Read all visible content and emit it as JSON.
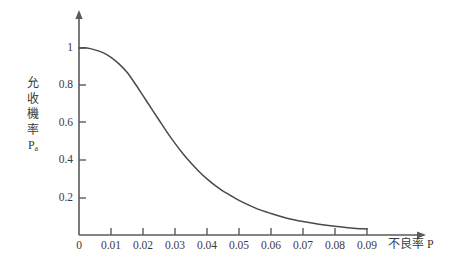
{
  "chart_data": {
    "type": "line",
    "title": "",
    "subtitle": "",
    "xlabel": "不良率 P",
    "ylabel": "允收機率 Pa",
    "ylabel_chars": [
      "允",
      "收",
      "機",
      "率"
    ],
    "ylabel_symbol": "P",
    "ylabel_symbol_sub": "a",
    "xlim": [
      0,
      0.09
    ],
    "ylim": [
      0,
      1.05
    ],
    "grid": false,
    "legend": null,
    "xticks": [
      0,
      0.01,
      0.02,
      0.03,
      0.04,
      0.05,
      0.06,
      0.07,
      0.08,
      0.09
    ],
    "xtick_labels": [
      "0",
      "0.01",
      "0.02",
      "0.03",
      "0.04",
      "0.05",
      "0.06",
      "0.07",
      "0.08",
      "0.09"
    ],
    "yticks": [
      0.2,
      0.4,
      0.6,
      0.8,
      1
    ],
    "ytick_labels": [
      "0.2",
      "0.4",
      "0.6",
      "0.8",
      "1"
    ],
    "series": [
      {
        "name": "允收機率 Pa",
        "color": "#4a4a4a",
        "x": [
          0,
          0.0025,
          0.005,
          0.0075,
          0.01,
          0.0125,
          0.015,
          0.0175,
          0.02,
          0.0225,
          0.025,
          0.0275,
          0.03,
          0.0325,
          0.035,
          0.0375,
          0.04,
          0.0425,
          0.045,
          0.0475,
          0.05,
          0.055,
          0.06,
          0.065,
          0.07,
          0.075,
          0.08,
          0.085,
          0.09
        ],
        "values": [
          1.0,
          1.0,
          0.99,
          0.975,
          0.95,
          0.915,
          0.87,
          0.81,
          0.745,
          0.68,
          0.615,
          0.55,
          0.49,
          0.435,
          0.385,
          0.34,
          0.3,
          0.265,
          0.235,
          0.21,
          0.185,
          0.145,
          0.115,
          0.09,
          0.072,
          0.058,
          0.047,
          0.038,
          0.032
        ]
      }
    ],
    "annotations": []
  },
  "axes": {
    "x_axis_name": "defect-rate-axis",
    "y_axis_name": "acceptance-probability-axis"
  }
}
